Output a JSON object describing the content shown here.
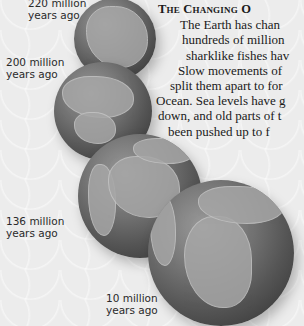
{
  "title_visible": "The Changing O",
  "body_lines": [
    "The Earth has chan",
    "hundreds of million",
    "sharklike fishes hav",
    "Slow movements of",
    "split them apart to for",
    "Ocean. Sea levels have g",
    "down, and old parts of t",
    "been pushed up to f"
  ],
  "globes": [
    {
      "label_line1": "220 million",
      "label_line2": "years ago"
    },
    {
      "label_line1": "200 million",
      "label_line2": "years ago"
    },
    {
      "label_line1": "136 million",
      "label_line2": "years ago"
    },
    {
      "label_line1": "10 million",
      "label_line2": "years ago"
    }
  ],
  "colors": {
    "background": "#f1f1f1",
    "text": "#1a1a1a",
    "globe_dark": "#2e2e2e",
    "land": "#a6a6a6"
  }
}
